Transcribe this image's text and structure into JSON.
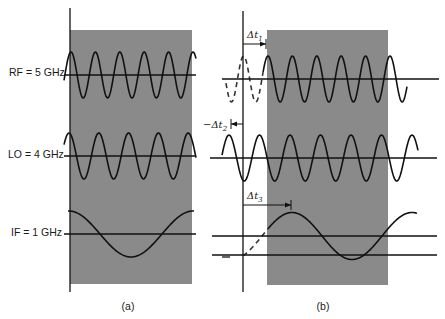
{
  "figure": {
    "background": "#ffffff",
    "shade_color": "#8a8a8a",
    "ink_color": "#111111"
  },
  "labels": {
    "rf": "RF = 5 GHz",
    "lo": "LO = 4 GHz",
    "if": "IF = 1 GHz"
  },
  "captions": {
    "a": "(a)",
    "b": "(b)"
  },
  "delays": {
    "dt1": {
      "prefix": "Δt",
      "sub": "1"
    },
    "dt2": {
      "prefix": "−Δt",
      "sub": "2"
    },
    "dt3": {
      "prefix": "Δt",
      "sub": "3"
    }
  },
  "panels": {
    "a": {
      "axis": {
        "x": 70,
        "y1": 8,
        "y2": 292
      },
      "shade": {
        "x": 70,
        "y": 30,
        "w": 122,
        "h": 254
      },
      "signals": {
        "rf": {
          "baseline_y": 75,
          "line_x1": 64,
          "line_x2": 196,
          "amp": 23,
          "period": 24.4,
          "phase_peak_x": 71,
          "x1": 64,
          "x2": 196
        },
        "lo": {
          "baseline_y": 156,
          "line_x1": 64,
          "line_x2": 196,
          "amp": 23,
          "period": 29.8,
          "phase_peak_x": 69,
          "x1": 64,
          "x2": 196
        },
        "if": {
          "baseline_y": 234,
          "line_x1": 64,
          "line_x2": 196,
          "amp": 23,
          "period": 124,
          "phase_peak_x": 69,
          "x1": 68,
          "x2": 194
        }
      }
    },
    "b": {
      "axis": {
        "x": 243,
        "y1": 11,
        "y2": 292
      },
      "shade": {
        "x": 267,
        "y": 30,
        "w": 121,
        "h": 255
      },
      "signals": {
        "rf": {
          "baseline_y": 79,
          "line_x1": 222,
          "line_x2": 439,
          "amp": 23,
          "period": 24.4,
          "phase_peak_x": 268,
          "x1": 263,
          "x2": 407,
          "dashed_x1": 226,
          "dashed_x2": 263
        },
        "lo": {
          "baseline_y": 158,
          "line_x1": 210,
          "line_x2": 437,
          "amp": 23,
          "period": 30.5,
          "phase_peak_x": 229,
          "x1": 222,
          "x2": 418
        },
        "if": {
          "baseline_y": 236,
          "baseline2_y": 255,
          "line_x1": 212,
          "line_x2": 437,
          "amp": 23.5,
          "period": 120,
          "phase_peak_x": 292,
          "x1": 268,
          "x2": 417,
          "dashed_x1": 243,
          "dashed_x2": 268
        }
      },
      "arrows": {
        "dt1": {
          "y": 44,
          "x1": 243,
          "x2": 266,
          "label_x": 247,
          "label_y": 38
        },
        "dt2": {
          "y": 124,
          "x1": 243,
          "x2": 231,
          "label_x": 203,
          "label_y": 128
        },
        "dt3": {
          "y": 205,
          "x1": 243,
          "x2": 291,
          "label_x": 247,
          "label_y": 199
        }
      }
    }
  },
  "label_positions": {
    "rf": {
      "x": 9,
      "y": 76
    },
    "lo": {
      "x": 8,
      "y": 158
    },
    "if": {
      "x": 11,
      "y": 236
    },
    "cap_a": {
      "x": 128,
      "y": 310
    },
    "cap_b": {
      "x": 323,
      "y": 310
    }
  }
}
